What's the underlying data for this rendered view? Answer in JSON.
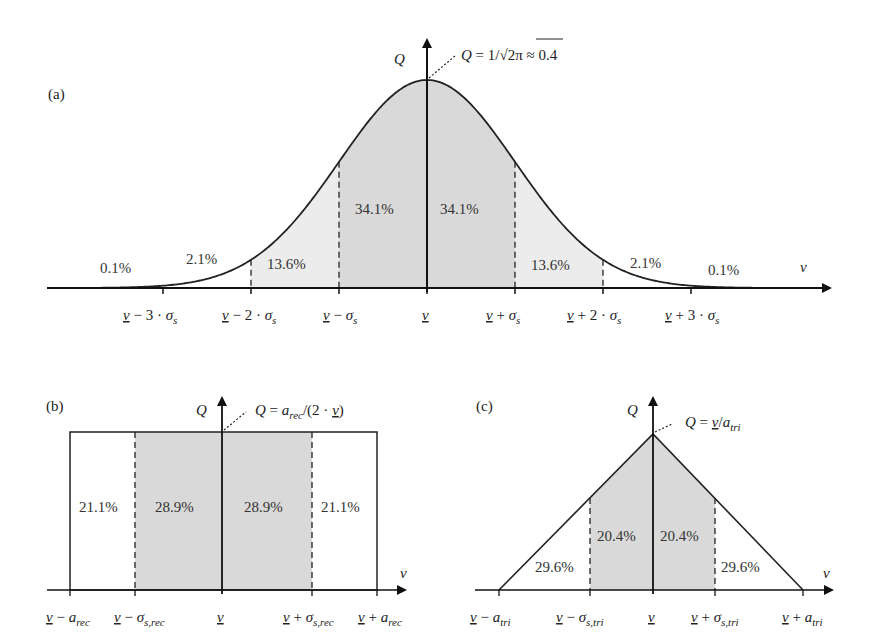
{
  "figure": {
    "panels": [
      {
        "id": "a",
        "label": "(a)"
      },
      {
        "id": "b",
        "label": "(b)"
      },
      {
        "id": "c",
        "label": "(c)"
      }
    ]
  },
  "colors": {
    "central_fill": "#d9d9d9",
    "outer_fill": "#ececec",
    "line": "#222222"
  },
  "chart_data": [
    {
      "type": "area",
      "title": "(a) Normal distribution",
      "xlabel": "ν",
      "ylabel": "Q",
      "peak_annotation": "Q = 1/√2π ≈ 0.4",
      "x_ticks": [
        "ν̲ − 3·σs",
        "ν̲ − 2·σs",
        "ν̲ − σs",
        "ν̲",
        "ν̲ + σs",
        "ν̲ + 2·σs",
        "ν̲ + 3·σs"
      ],
      "segments": [
        "<-3σ",
        "-3σ..-2σ",
        "-2σ..-σ",
        "-σ..μ",
        "μ..+σ",
        "+σ..+2σ",
        "+2σ..+3σ",
        ">+3σ"
      ],
      "values_percent": [
        0.1,
        2.1,
        13.6,
        34.1,
        34.1,
        13.6,
        2.1,
        0.1
      ],
      "labels": [
        "0.1%",
        "2.1%",
        "13.6%",
        "34.1%",
        "34.1%",
        "13.6%",
        "2.1%",
        "0.1%"
      ],
      "peak_value": 0.4
    },
    {
      "type": "area",
      "title": "(b) Rectangular distribution",
      "xlabel": "ν",
      "ylabel": "Q",
      "peak_annotation": "Q = a_rec/(2·ν̲)",
      "x_ticks": [
        "ν̲ − a_rec",
        "ν̲ − σ_s,rec",
        "ν̲",
        "ν̲ + σ_s,rec",
        "ν̲ + a_rec"
      ],
      "segments": [
        "-a..-σ",
        "-σ..μ",
        "μ..+σ",
        "+σ..+a"
      ],
      "values_percent": [
        21.1,
        28.9,
        28.9,
        21.1
      ],
      "labels": [
        "21.1%",
        "28.9%",
        "28.9%",
        "21.1%"
      ]
    },
    {
      "type": "area",
      "title": "(c) Triangular distribution",
      "xlabel": "ν",
      "ylabel": "Q",
      "peak_annotation": "Q = ν̲/a_tri",
      "x_ticks": [
        "ν̲ − a_tri",
        "ν̲ − σ_s,tri",
        "ν̲",
        "ν̲ + σ_s,tri",
        "ν̲ + a_tri"
      ],
      "segments": [
        "-a..-σ",
        "-σ..μ",
        "μ..+σ",
        "+σ..+a"
      ],
      "values_percent": [
        29.6,
        20.4,
        20.4,
        29.6
      ],
      "labels": [
        "29.6%",
        "20.4%",
        "20.4%",
        "29.6%"
      ]
    }
  ],
  "text": {
    "a": {
      "panel": "(a)",
      "q": "Q",
      "nu": "ν",
      "ann_q": "Q",
      "ann_eq": " = 1/√",
      "ann_2pi": "2π",
      "ann_approx": " ≈ 0.4",
      "p1": "0.1%",
      "p2": "2.1%",
      "p3": "13.6%",
      "p4": "34.1%",
      "p5": "34.1%",
      "p6": "13.6%",
      "p7": "2.1%",
      "p8": "0.1%",
      "nu_bar": "ν",
      "minus3": " − 3 · ",
      "minus2": " − 2 · ",
      "minus1": " − ",
      "plus1": " + ",
      "plus2": " + 2 · ",
      "plus3": " + 3 · ",
      "sigma": "σ",
      "s": "s"
    },
    "b": {
      "panel": "(b)",
      "q": "Q",
      "nu": "ν",
      "ann_q": "Q",
      "ann_eq": " = ",
      "ann_a": "a",
      "ann_rec": "rec",
      "ann_rest": "/(2 · ",
      "ann_nu": "ν",
      "ann_close": ")",
      "p1": "21.1%",
      "p2": "28.9%",
      "p3": "28.9%",
      "p4": "21.1%",
      "nu_bar": "ν",
      "minus": " − ",
      "plus": " + ",
      "a": "a",
      "rec": "rec",
      "sigma": "σ",
      "srec": "s,rec"
    },
    "c": {
      "panel": "(c)",
      "q": "Q",
      "nu": "ν",
      "ann_q": "Q",
      "ann_eq": " = ",
      "ann_nu": "ν",
      "ann_slash": "/",
      "ann_a": "a",
      "ann_tri": "tri",
      "p1": "29.6%",
      "p2": "20.4%",
      "p3": "20.4%",
      "p4": "29.6%",
      "nu_bar": "ν",
      "minus": " − ",
      "plus": " + ",
      "a": "a",
      "tri": "tri",
      "sigma": "σ",
      "stri": "s,tri"
    }
  }
}
